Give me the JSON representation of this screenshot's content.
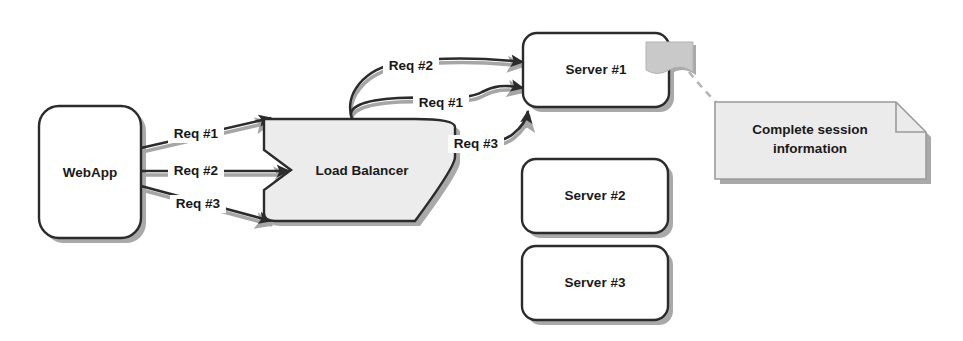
{
  "diagram": {
    "canvas": {
      "width": 963,
      "height": 341,
      "background": "#ffffff"
    },
    "colors": {
      "stroke": "#2b2b2b",
      "shadow": "#9a9a9a",
      "fill_white": "#ffffff",
      "fill_gray": "#e8e8e8",
      "flag_gray": "#c9c9c9",
      "dashed_gray": "#b0b0b0",
      "text": "#1a1a1a"
    },
    "nodes": [
      {
        "id": "webapp",
        "label": "WebApp",
        "shape": "rounded-rect",
        "fill": "#ffffff"
      },
      {
        "id": "load-balancer",
        "label": "Load Balancer",
        "shape": "pentagon-arrow",
        "fill": "#ececec"
      },
      {
        "id": "server-1",
        "label": "Server #1",
        "shape": "rounded-rect",
        "fill": "#ffffff"
      },
      {
        "id": "server-2",
        "label": "Server #2",
        "shape": "rounded-rect",
        "fill": "#ffffff"
      },
      {
        "id": "server-3",
        "label": "Server #3",
        "shape": "rounded-rect",
        "fill": "#ffffff"
      },
      {
        "id": "session-note",
        "label_line1": "Complete session",
        "label_line2": "information",
        "shape": "note-folded-corner",
        "fill": "#ebebeb"
      },
      {
        "id": "session-flag",
        "label": "",
        "shape": "flag-ribbon",
        "fill": "#c9c9c9"
      }
    ],
    "edges": [
      {
        "id": "webapp-lb-1",
        "label": "Req #1",
        "from": "webapp",
        "to": "load-balancer"
      },
      {
        "id": "webapp-lb-2",
        "label": "Req #2",
        "from": "webapp",
        "to": "load-balancer"
      },
      {
        "id": "webapp-lb-3",
        "label": "Req #3",
        "from": "webapp",
        "to": "load-balancer"
      },
      {
        "id": "lb-server1-2",
        "label": "Req #2",
        "from": "load-balancer",
        "to": "server-1"
      },
      {
        "id": "lb-server1-1",
        "label": "Req #1",
        "from": "load-balancer",
        "to": "server-1"
      },
      {
        "id": "lb-server1-3",
        "label": "Req #3",
        "from": "load-balancer",
        "to": "server-1"
      }
    ],
    "connectors": [
      {
        "id": "flag-to-note",
        "style": "dashed",
        "from": "session-flag",
        "to": "session-note"
      }
    ]
  }
}
